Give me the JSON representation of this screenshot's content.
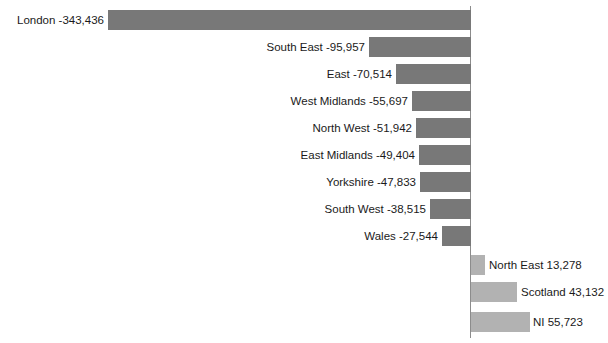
{
  "chart_data": {
    "type": "bar",
    "orientation": "horizontal",
    "title": "",
    "xlabel": "",
    "ylabel": "",
    "grid": false,
    "legend": "none",
    "axis_zero_line": true,
    "xlim": [
      -343436,
      55723
    ],
    "categories": [
      "London",
      "South East",
      "East",
      "West Midlands",
      "North West",
      "East Midlands",
      "Yorkshire",
      "South West",
      "Wales",
      "North East",
      "Scotland",
      "NI"
    ],
    "values": [
      -343436,
      -95957,
      -70514,
      -55697,
      -51942,
      -49404,
      -47833,
      -38515,
      -27544,
      13278,
      43132,
      55723
    ],
    "value_labels": [
      "-343,436",
      "-95,957",
      "-70,514",
      "-55,697",
      "-51,942",
      "-49,404",
      "-47,833",
      "-38,515",
      "-27,544",
      "13,278",
      "43,132",
      "55,723"
    ],
    "point_labels": [
      "London -343,436",
      "South East -95,957",
      "East -70,514",
      "West Midlands -55,697",
      "North West -51,942",
      "East Midlands -49,404",
      "Yorkshire -47,833",
      "South West -38,515",
      "Wales -27,544",
      "North East 13,278",
      "Scotland 43,132",
      "NI 55,723"
    ],
    "colors": {
      "negative_bar": "#787878",
      "positive_bar": "#b2b2b2",
      "axis_line": "#8c8c8c",
      "label_text": "#1a1a1a",
      "background": "#ffffff"
    }
  },
  "chart": {
    "rows": [
      {
        "label": "London -343,436",
        "value": -343436,
        "sign": "neg",
        "top": 10,
        "bar_left": 108,
        "bar_width": 363,
        "label_left": 0,
        "label_width": 104
      },
      {
        "label": "South East -95,957",
        "value": -95957,
        "sign": "neg",
        "top": 37,
        "bar_left": 369,
        "bar_width": 102,
        "label_left": 230,
        "label_width": 135
      },
      {
        "label": "East -70,514",
        "value": -70514,
        "sign": "neg",
        "top": 64,
        "bar_left": 396,
        "bar_width": 75,
        "label_left": 290,
        "label_width": 102
      },
      {
        "label": "West Midlands -55,697",
        "value": -55697,
        "sign": "neg",
        "top": 91,
        "bar_left": 412,
        "bar_width": 59,
        "label_left": 248,
        "label_width": 160
      },
      {
        "label": "North West -51,942",
        "value": -51942,
        "sign": "neg",
        "top": 118,
        "bar_left": 416,
        "bar_width": 55,
        "label_left": 272,
        "label_width": 140
      },
      {
        "label": "East Midlands -49,404",
        "value": -49404,
        "sign": "neg",
        "top": 145,
        "bar_left": 419,
        "bar_width": 52,
        "label_left": 255,
        "label_width": 160
      },
      {
        "label": "Yorkshire -47,833",
        "value": -47833,
        "sign": "neg",
        "top": 172,
        "bar_left": 420,
        "bar_width": 51,
        "label_left": 282,
        "label_width": 134
      },
      {
        "label": "South West -38,515",
        "value": -38515,
        "sign": "neg",
        "top": 199,
        "bar_left": 430,
        "bar_width": 41,
        "label_left": 282,
        "label_width": 144
      },
      {
        "label": "Wales -27,544",
        "value": -27544,
        "sign": "neg",
        "top": 226,
        "bar_left": 442,
        "bar_width": 29,
        "label_left": 320,
        "label_width": 118
      },
      {
        "label": "North East 13,278",
        "value": 13278,
        "sign": "pos",
        "top": 255,
        "bar_left": 471,
        "bar_width": 14,
        "label_left": 489,
        "label_width": 119
      },
      {
        "label": "Scotland 43,132",
        "value": 43132,
        "sign": "pos",
        "top": 282,
        "bar_left": 471,
        "bar_width": 46,
        "label_left": 521,
        "label_width": 87
      },
      {
        "label": "NI 55,723",
        "value": 55723,
        "sign": "pos",
        "top": 312,
        "bar_left": 471,
        "bar_width": 59,
        "label_left": 533,
        "label_width": 75
      }
    ]
  }
}
